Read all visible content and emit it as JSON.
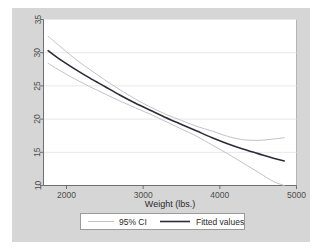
{
  "figure": {
    "outer_background": "#ffffff",
    "graph_region_background": "#d6d6d6",
    "plot_background": "#ffffff",
    "border_color": "#bdbdbd"
  },
  "chart_data": {
    "type": "line",
    "title": "",
    "subtitle": "",
    "xlabel": "Weight (lbs.)",
    "ylabel": "",
    "xlim": [
      1700,
      5000
    ],
    "ylim": [
      10,
      35
    ],
    "xticks": [
      2000,
      3000,
      4000,
      5000
    ],
    "xtick_labels": [
      "2000",
      "3000",
      "4000",
      "5000"
    ],
    "yticks": [
      10,
      15,
      20,
      25,
      30,
      35
    ],
    "ytick_labels": [
      "10",
      "15",
      "20",
      "25",
      "30",
      "35"
    ],
    "grid": "horizontal",
    "grid_color": "#e8e8e8",
    "legend_position": "bottom-outside",
    "series": [
      {
        "name": "95% CI",
        "role": "confidence-band-upper",
        "color": "#c3c3c3",
        "width": 1,
        "x": [
          1760,
          1900,
          2100,
          2300,
          2500,
          2700,
          2900,
          3100,
          3300,
          3500,
          3700,
          3900,
          4100,
          4300,
          4500,
          4700,
          4840
        ],
        "y": [
          32.5,
          31.1,
          29.2,
          27.5,
          25.9,
          24.4,
          23.0,
          21.8,
          20.7,
          19.8,
          18.9,
          18.2,
          17.4,
          16.9,
          16.8,
          17.0,
          17.2
        ]
      },
      {
        "name": "Fitted values",
        "role": "fit",
        "color": "#2b2b3a",
        "width": 1.6,
        "x": [
          1760,
          1900,
          2100,
          2300,
          2500,
          2700,
          2900,
          3100,
          3300,
          3500,
          3700,
          3900,
          4100,
          4300,
          4500,
          4700,
          4840
        ],
        "y": [
          30.3,
          29.1,
          27.6,
          26.2,
          24.9,
          23.6,
          22.4,
          21.3,
          20.2,
          19.2,
          18.2,
          17.2,
          16.3,
          15.5,
          14.8,
          14.1,
          13.7
        ]
      },
      {
        "name": "95% CI",
        "role": "confidence-band-lower",
        "color": "#c3c3c3",
        "width": 1,
        "x": [
          1760,
          1900,
          2100,
          2300,
          2500,
          2700,
          2900,
          3100,
          3300,
          3500,
          3700,
          3900,
          4100,
          4300,
          4500,
          4700,
          4840
        ],
        "y": [
          28.4,
          27.4,
          26.1,
          24.9,
          23.8,
          22.7,
          21.7,
          20.7,
          19.6,
          18.5,
          17.4,
          16.1,
          14.8,
          13.4,
          12.0,
          10.6,
          10.0
        ]
      }
    ]
  },
  "legend": {
    "entries": [
      {
        "label": "95% CI",
        "color": "#c3c3c3",
        "width": 1
      },
      {
        "label": "Fitted values",
        "color": "#2b2b3a",
        "width": 1.6
      }
    ]
  }
}
